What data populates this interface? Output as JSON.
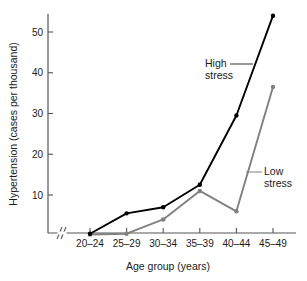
{
  "chart_data": {
    "type": "line",
    "title": "",
    "xlabel": "Age group (years)",
    "ylabel": "Hypertension (cases per thousand)",
    "categories": [
      "20–24",
      "25–29",
      "30–34",
      "35–39",
      "40–44",
      "45–49"
    ],
    "ytick_labels": [
      "10",
      "20",
      "30",
      "40",
      "50"
    ],
    "ytick_values": [
      10,
      20,
      30,
      40,
      50
    ],
    "ylim": [
      0,
      57
    ],
    "grid": false,
    "legend_position": "inline-annotations",
    "axis_break": "x-axis break between origin and first category",
    "series": [
      {
        "name": "High stress",
        "color": "#000000",
        "marker": "filled-circle",
        "values": [
          0.5,
          5.5,
          7.0,
          12.5,
          29.5,
          54.0
        ]
      },
      {
        "name": "Low stress",
        "color": "#808080",
        "marker": "filled-circle",
        "values": [
          0.3,
          0.5,
          4.0,
          11.0,
          6.0,
          36.5
        ]
      }
    ],
    "annotations": [
      {
        "text_line1": "High",
        "text_line2": "stress",
        "target_series": "High stress"
      },
      {
        "text_line1": "Low",
        "text_line2": "stress",
        "target_series": "Low stress"
      }
    ]
  }
}
